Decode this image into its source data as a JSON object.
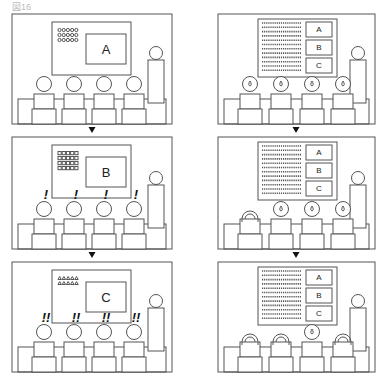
{
  "figure": {
    "label": "図16",
    "colors": {
      "line": "#555555",
      "text": "#222222",
      "background": "#ffffff"
    }
  },
  "left_column": {
    "panels": [
      {
        "id": "L1",
        "slide_letter": "A",
        "list_icon": "circle-bullets",
        "list_rows": 3,
        "list_cols": 5,
        "audience_reaction": "",
        "reactions": [
          "",
          "",
          "",
          ""
        ]
      },
      {
        "id": "L2",
        "slide_letter": "B",
        "list_icon": "square-bullets",
        "list_rows": 4,
        "list_cols": 5,
        "audience_reaction": "!",
        "reactions": [
          "!",
          "!",
          "!",
          "!"
        ]
      },
      {
        "id": "L3",
        "slide_letter": "C",
        "list_icon": "triangle-bullets",
        "list_rows": 2,
        "list_cols": 5,
        "audience_reaction": "!!",
        "reactions": [
          "!!",
          "!!",
          "!!",
          "!!"
        ]
      }
    ]
  },
  "right_column": {
    "panels": [
      {
        "id": "R1",
        "slide_boxes": [
          "A",
          "B",
          "C"
        ],
        "audience_states": [
          "sweat",
          "sweat",
          "sweat",
          "sweat"
        ]
      },
      {
        "id": "R2",
        "slide_boxes": [
          "A",
          "B",
          "C"
        ],
        "audience_states": [
          "asleep",
          "sweat",
          "sweat",
          "sweat"
        ]
      },
      {
        "id": "R3",
        "slide_boxes": [
          "A",
          "B",
          "C"
        ],
        "audience_states": [
          "asleep",
          "asleep",
          "sweat",
          "asleep"
        ]
      }
    ]
  },
  "arrows": {
    "glyph": "▼",
    "count_per_column": 2
  }
}
